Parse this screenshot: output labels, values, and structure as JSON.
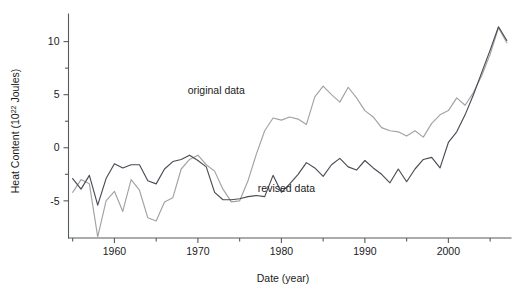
{
  "chart_data": {
    "type": "line",
    "title": "",
    "subtitle": "",
    "xlabel": "Date (year)",
    "ylabel": "Heat Content (10^22 Joules)",
    "ylabel_prefix": "Heat Content (10",
    "ylabel_exponent": "22",
    "ylabel_suffix": " Joules)",
    "xlim": [
      1954.5,
      2007.5
    ],
    "ylim": [
      -8.5,
      12.6
    ],
    "grid": false,
    "legend_position": "inline-annotations",
    "x_major_ticks": [
      1960,
      1970,
      1980,
      1990,
      2000
    ],
    "x_major_tick_labels": [
      "1960",
      "1970",
      "1980",
      "1990",
      "2000"
    ],
    "x_minor_ticks": [
      1955,
      1965,
      1975,
      1985,
      1995,
      2005
    ],
    "y_major_ticks": [
      -5,
      0,
      5,
      10
    ],
    "y_major_tick_labels": [
      "-5",
      "0",
      "5",
      "10"
    ],
    "y_minor_ticks": [
      -2.5,
      2.5,
      7.5
    ],
    "series": [
      {
        "name": "original data",
        "label": "original data",
        "color": "#a2a2a2",
        "label_x": 1972.2,
        "label_y": 5.05,
        "x": [
          1955,
          1956,
          1957,
          1958,
          1959,
          1960,
          1961,
          1962,
          1963,
          1964,
          1965,
          1966,
          1967,
          1968,
          1969,
          1970,
          1971,
          1972,
          1973,
          1974,
          1975,
          1976,
          1977,
          1978,
          1979,
          1980,
          1981,
          1982,
          1983,
          1984,
          1985,
          1986,
          1987,
          1988,
          1989,
          1990,
          1991,
          1992,
          1993,
          1994,
          1995,
          1996,
          1997,
          1998,
          1999,
          2000,
          2001,
          2002,
          2003,
          2004,
          2005,
          2006,
          2007
        ],
        "y": [
          -4.2,
          -3.0,
          -3.4,
          -8.4,
          -5.0,
          -4.1,
          -6.0,
          -3.0,
          -4.0,
          -6.6,
          -6.9,
          -5.1,
          -4.7,
          -2.0,
          -1.1,
          -0.7,
          -1.6,
          -2.2,
          -3.9,
          -5.1,
          -5.0,
          -3.1,
          -0.6,
          1.6,
          2.8,
          2.6,
          2.9,
          2.7,
          2.2,
          4.8,
          5.8,
          5.0,
          4.3,
          5.7,
          4.7,
          3.5,
          2.9,
          1.9,
          1.6,
          1.5,
          1.1,
          1.6,
          1.0,
          2.3,
          3.1,
          3.5,
          4.7,
          4.0,
          5.2,
          6.8,
          8.8,
          11.3,
          9.9
        ]
      },
      {
        "name": "revised data",
        "label": "revised data",
        "color": "#4b4b55",
        "label_x": 1980.6,
        "label_y": -4.15,
        "x": [
          1955,
          1956,
          1957,
          1958,
          1959,
          1960,
          1961,
          1962,
          1963,
          1964,
          1965,
          1966,
          1967,
          1968,
          1969,
          1970,
          1971,
          1972,
          1973,
          1974,
          1975,
          1976,
          1977,
          1978,
          1979,
          1980,
          1981,
          1982,
          1983,
          1984,
          1985,
          1986,
          1987,
          1988,
          1989,
          1990,
          1991,
          1992,
          1993,
          1994,
          1995,
          1996,
          1997,
          1998,
          1999,
          2000,
          2001,
          2002,
          2003,
          2004,
          2005,
          2006,
          2007
        ],
        "y": [
          -2.9,
          -3.9,
          -2.6,
          -5.4,
          -2.9,
          -1.5,
          -1.9,
          -1.6,
          -1.6,
          -3.1,
          -3.4,
          -2.0,
          -1.3,
          -1.1,
          -0.7,
          -1.2,
          -1.8,
          -4.2,
          -4.9,
          -4.9,
          -4.8,
          -4.6,
          -4.5,
          -4.6,
          -2.6,
          -4.2,
          -3.4,
          -2.5,
          -1.4,
          -1.9,
          -2.7,
          -1.6,
          -1.0,
          -1.8,
          -2.1,
          -1.2,
          -1.9,
          -2.5,
          -3.3,
          -2.0,
          -3.2,
          -2.0,
          -1.1,
          -0.9,
          -1.9,
          0.5,
          1.5,
          3.1,
          5.0,
          7.1,
          9.2,
          11.4,
          10.1
        ]
      }
    ]
  },
  "figure": {
    "background_color": "#ffffff",
    "axis_color": "#555a5e",
    "text_color": "#1b1b1b"
  }
}
